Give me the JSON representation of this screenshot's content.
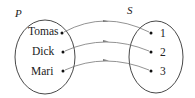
{
  "diagram": {
    "type": "mapping",
    "domain_set": {
      "label": "P",
      "elements": [
        "Tomas",
        "Dick",
        "Mari"
      ]
    },
    "codomain_set": {
      "label": "S",
      "elements": [
        "1",
        "2",
        "3"
      ]
    },
    "mappings": [
      {
        "from": "Tomas",
        "to": "1"
      },
      {
        "from": "Dick",
        "to": "2"
      },
      {
        "from": "Mari",
        "to": "3"
      }
    ],
    "colors": {
      "stroke": "#333333",
      "arrow": "#777777",
      "text": "#222222"
    }
  }
}
